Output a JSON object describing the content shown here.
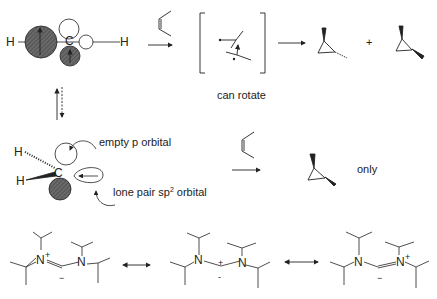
{
  "colors": {
    "ink": "#222222",
    "filled_orbital": "#555555",
    "background": "#ffffff"
  },
  "top_row": {
    "orbital_atoms": {
      "left_h": "H",
      "carbon": "C",
      "right_h": "H"
    },
    "reagent": "cis-2-butene",
    "bracket_note": "can rotate",
    "plus": "+",
    "products": [
      "trans-1,2-dimethylcyclopropane",
      "cis-1,2-dimethylcyclopropane"
    ]
  },
  "middle_row": {
    "atoms": {
      "h_hash": "H",
      "h_wedge": "H",
      "carbon": "C"
    },
    "label_empty_p": "empty p orbital",
    "label_lone_pair_prefix": "lone pair sp",
    "label_lone_pair_sup": "2",
    "label_lone_pair_suffix": " orbital",
    "reagent": "cis-2-butene",
    "product": "cis-1,2-dimethylcyclopropane",
    "note": "only"
  },
  "bottom_row": {
    "resonance_structures": [
      {
        "n_left": "N",
        "n_left_charge": "+",
        "n_right": "N",
        "carbon_charge": "−"
      },
      {
        "n_left": "N",
        "n_right": "N",
        "carbon_charge_top": "+",
        "carbon_charge_bottom": "-"
      },
      {
        "n_left": "N",
        "n_right": "N",
        "n_right_charge": "+",
        "carbon_charge": "−"
      }
    ]
  },
  "icons": [
    "reaction-arrow",
    "equilibrium-arrow",
    "resonance-arrow",
    "curved-arrow"
  ]
}
